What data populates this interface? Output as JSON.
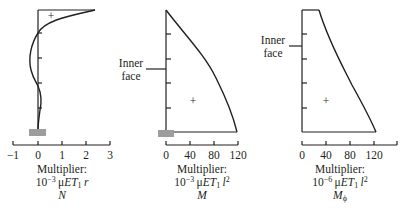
{
  "figure": {
    "panels": [
      {
        "id": "N",
        "symbol": "N",
        "multiplier_label": "Multiplier:",
        "multiplier_prefix": "10",
        "multiplier_exp": "−3",
        "multiplier_mu": "μ",
        "multiplier_E": "E",
        "multiplier_T": "T",
        "multiplier_sub": "1",
        "multiplier_var": "r",
        "sign": "+",
        "x_ticks": [
          "−1",
          "0",
          "1",
          "2",
          "3"
        ]
      },
      {
        "id": "M",
        "symbol": "M",
        "multiplier_label": "Multiplier:",
        "multiplier_prefix": "10",
        "multiplier_exp": "−3",
        "multiplier_mu": "μ",
        "multiplier_E": "E",
        "multiplier_T": "T",
        "multiplier_sub": "1",
        "multiplier_var": "l",
        "multiplier_var_exp": "2",
        "sign": "+",
        "side_label_line1": "Inner",
        "side_label_line2": "face",
        "x_ticks": [
          "0",
          "40",
          "80",
          "120"
        ]
      },
      {
        "id": "Mphi",
        "symbol": "M",
        "symbol_sub": "ϕ",
        "multiplier_label": "Multiplier:",
        "multiplier_prefix": "10",
        "multiplier_exp": "−6",
        "multiplier_mu": "μ",
        "multiplier_E": "E",
        "multiplier_T": "T",
        "multiplier_sub": "1",
        "multiplier_var": "l",
        "multiplier_var_exp": "2",
        "sign": "+",
        "side_label_line1": "Inner",
        "side_label_line2": "face",
        "x_ticks": [
          "0",
          "40",
          "80",
          "120"
        ]
      }
    ],
    "colors": {
      "line": "#231f20",
      "base_hatch": "#9d9d9d"
    }
  }
}
